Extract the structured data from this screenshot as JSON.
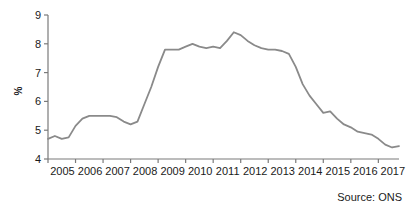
{
  "chart_data": {
    "type": "line",
    "title": "",
    "subtitle": "",
    "xlabel": "",
    "ylabel": "%",
    "ylim": [
      4,
      9
    ],
    "xlim": [
      2005.0,
      2017.75
    ],
    "grid": false,
    "legend": false,
    "legend_position": "none",
    "source_note": "Source: ONS",
    "line_color": "#8a8a8a",
    "axis_color": "#7a7a7a",
    "background_color": "#ffffff",
    "y_ticks": [
      4,
      5,
      6,
      7,
      8,
      9
    ],
    "y_tick_labels": [
      "4",
      "5",
      "6",
      "7",
      "8",
      "9"
    ],
    "x_ticks": [
      2005,
      2006,
      2007,
      2008,
      2009,
      2010,
      2011,
      2012,
      2013,
      2014,
      2015,
      2016,
      2017
    ],
    "x_tick_labels": [
      "2005",
      "2006",
      "2007",
      "2008",
      "2009",
      "2010",
      "2011",
      "2012",
      "2013",
      "2014",
      "2015",
      "2016",
      "2017"
    ],
    "series": [
      {
        "name": "Unemployment rate",
        "x": [
          2005.0,
          2005.25,
          2005.5,
          2005.75,
          2006.0,
          2006.25,
          2006.5,
          2006.75,
          2007.0,
          2007.25,
          2007.5,
          2007.75,
          2008.0,
          2008.25,
          2008.5,
          2008.75,
          2009.0,
          2009.25,
          2009.5,
          2009.75,
          2010.0,
          2010.25,
          2010.5,
          2010.75,
          2011.0,
          2011.25,
          2011.5,
          2011.75,
          2012.0,
          2012.25,
          2012.5,
          2012.75,
          2013.0,
          2013.25,
          2013.5,
          2013.75,
          2014.0,
          2014.25,
          2014.5,
          2014.75,
          2015.0,
          2015.25,
          2015.5,
          2015.75,
          2016.0,
          2016.25,
          2016.5,
          2016.75,
          2017.0,
          2017.25,
          2017.5,
          2017.75
        ],
        "values": [
          4.7,
          4.8,
          4.7,
          4.75,
          5.15,
          5.4,
          5.5,
          5.5,
          5.5,
          5.5,
          5.45,
          5.3,
          5.2,
          5.3,
          5.9,
          6.5,
          7.2,
          7.8,
          7.8,
          7.8,
          7.9,
          8.0,
          7.9,
          7.85,
          7.9,
          7.85,
          8.1,
          8.4,
          8.3,
          8.1,
          7.95,
          7.85,
          7.8,
          7.8,
          7.75,
          7.65,
          7.2,
          6.6,
          6.2,
          5.9,
          5.6,
          5.65,
          5.4,
          5.2,
          5.1,
          4.95,
          4.9,
          4.85,
          4.7,
          4.5,
          4.4,
          4.45
        ]
      }
    ]
  }
}
